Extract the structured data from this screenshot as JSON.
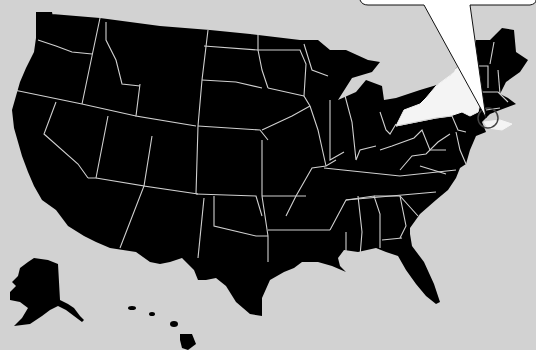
{
  "map": {
    "type": "us-states-silhouette",
    "background_color": "#d2d2d2",
    "state_fill": "#000000",
    "border_color": "#d8d8d8",
    "highlighted_region": {
      "name": "New York",
      "fill": "#f4f4f4",
      "marker": "circle-around-new-york-city"
    },
    "insets": [
      "Alaska",
      "Hawaii"
    ]
  },
  "callout": {
    "shape": "speech-bubble",
    "fill": "#ffffff",
    "stroke": "#111111",
    "text": ""
  }
}
